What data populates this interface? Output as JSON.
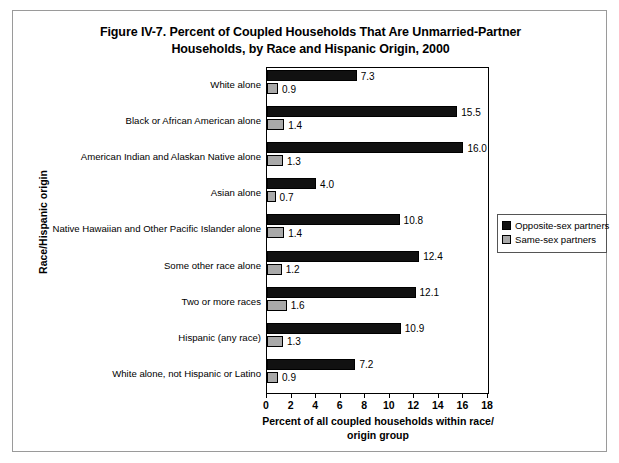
{
  "figure": {
    "title_line1": "Figure IV-7. Percent of Coupled Households That Are Unmarried-Partner",
    "title_line2": "Households, by Race and Hispanic Origin, 2000",
    "yaxis_title": "Race/Hispanic origin",
    "xaxis_title_line1": "Percent of all coupled households within race/",
    "xaxis_title_line2": "origin group"
  },
  "legend": {
    "items": [
      {
        "label": "Opposite-sex partners",
        "color": "#111111",
        "swatch": "opposite-sex-swatch"
      },
      {
        "label": "Same-sex partners",
        "color": "#a9a9a9",
        "swatch": "same-sex-swatch"
      }
    ]
  },
  "chart_data": {
    "type": "bar",
    "orientation": "horizontal",
    "title": "Figure IV-7. Percent of Coupled Households That Are Unmarried-Partner Households, by Race and Hispanic Origin, 2000",
    "xlabel": "Percent of all coupled households within race/origin group",
    "ylabel": "Race/Hispanic origin",
    "xlim": [
      0,
      18
    ],
    "xticks": [
      0,
      2,
      4,
      6,
      8,
      10,
      12,
      14,
      16,
      18
    ],
    "xtick_labels": [
      "0",
      "2",
      "4",
      "6",
      "8",
      "10",
      "12",
      "14",
      "16",
      "18"
    ],
    "grid": false,
    "legend_position": "right",
    "categories": [
      "White alone",
      "Black or African American alone",
      "American Indian and Alaskan Native alone",
      "Asian alone",
      "Native Hawaiian and Other Pacific Islander alone",
      "Some other race alone",
      "Two or more races",
      "Hispanic (any race)",
      "White alone, not Hispanic or Latino"
    ],
    "series": [
      {
        "name": "Opposite-sex partners",
        "color": "#111111",
        "values": [
          7.3,
          15.5,
          16.0,
          4.0,
          10.8,
          12.4,
          12.1,
          10.9,
          7.2
        ],
        "labels": [
          "7.3",
          "15.5",
          "16.0",
          "4.0",
          "10.8",
          "12.4",
          "12.1",
          "10.9",
          "7.2"
        ]
      },
      {
        "name": "Same-sex partners",
        "color": "#a9a9a9",
        "values": [
          0.9,
          1.4,
          1.3,
          0.7,
          1.4,
          1.2,
          1.6,
          1.3,
          0.9
        ],
        "labels": [
          "0.9",
          "1.4",
          "1.3",
          "0.7",
          "1.4",
          "1.2",
          "1.6",
          "1.3",
          "0.9"
        ]
      }
    ]
  }
}
